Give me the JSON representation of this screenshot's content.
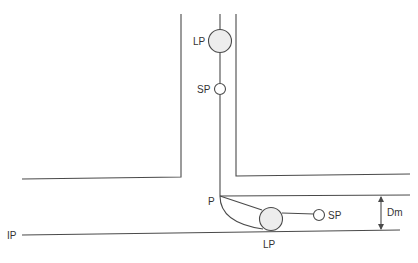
{
  "diagram": {
    "type": "pipe-junction-schematic",
    "colors": {
      "line": "#4a4a4a",
      "large_particle_fill": "#ededed",
      "background": "#ffffff"
    },
    "labels": {
      "lp_top": "LP",
      "sp_top": "SP",
      "p_junction": "P",
      "sp_bottom": "SP",
      "lp_bottom": "LP",
      "dm": "Dm",
      "ip": "IP"
    }
  }
}
